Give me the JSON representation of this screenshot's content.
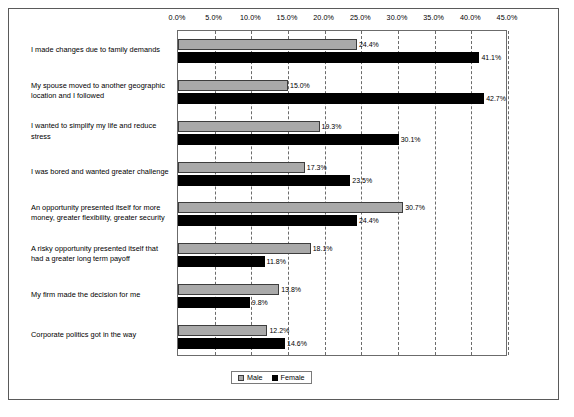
{
  "chart_data": {
    "type": "bar",
    "orientation": "horizontal",
    "title": "",
    "xlabel": "",
    "ylabel": "",
    "xlim": [
      0,
      45
    ],
    "grid": true,
    "legend_position": "bottom",
    "xticks": [
      "0.0%",
      "5.0%",
      "10.0%",
      "15.0%",
      "20.0%",
      "25.0%",
      "30.0%",
      "35.0%",
      "40.0%",
      "45.0%"
    ],
    "xtick_values": [
      0,
      5,
      10,
      15,
      20,
      25,
      30,
      35,
      40,
      45
    ],
    "categories": [
      "I made changes due to family demands",
      "My spouse moved to another geographic location and I followed",
      "I wanted to simplify my life and reduce stress",
      "I was bored and wanted greater challenge",
      "An opportunity presented itself for more money, greater flexibility, greater security",
      "A risky opportunity presented itself that had a greater long term payoff",
      "My firm made the decision for me",
      "Corporate politics got in the way"
    ],
    "series": [
      {
        "name": "Male",
        "color": "#a9a9a9",
        "values": [
          24.4,
          15.0,
          19.3,
          17.3,
          30.7,
          18.1,
          13.8,
          12.2
        ],
        "labels": [
          "24.4%",
          "15.0%",
          "19.3%",
          "17.3%",
          "30.7%",
          "18.1%",
          "13.8%",
          "12.2%"
        ]
      },
      {
        "name": "Female",
        "color": "#000000",
        "values": [
          41.1,
          42.7,
          30.1,
          23.5,
          24.4,
          11.8,
          9.8,
          14.6
        ],
        "labels": [
          "41.1%",
          "42.7%",
          "30.1%",
          "23.5%",
          "24.4%",
          "11.8%",
          "9.8%",
          "14.6%"
        ]
      }
    ]
  },
  "legend": {
    "entries": [
      {
        "label": "Male"
      },
      {
        "label": "Female"
      }
    ]
  }
}
